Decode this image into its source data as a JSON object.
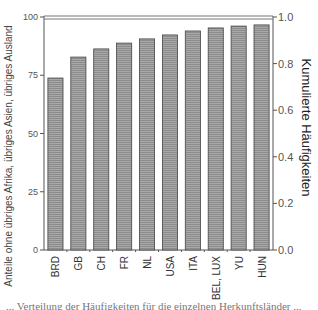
{
  "chart_data": {
    "type": "bar",
    "title": "",
    "categories": [
      "BRD",
      "GB",
      "CH",
      "FR",
      "NL",
      "USA",
      "ITA",
      "BEL, LUX",
      "YU",
      "HUN"
    ],
    "values": [
      73.8,
      82.8,
      86.3,
      88.8,
      90.6,
      92.3,
      94.0,
      95.3,
      96.1,
      96.6
    ],
    "xlabel": "",
    "ylabel": "Anteile ohne übriges Afrika, übriges Asien, übriges Ausland",
    "y2label": "Kumulierte Häufigkeiten",
    "ylim": [
      0,
      100
    ],
    "y2lim": [
      0.0,
      1.0
    ],
    "yticks": [
      "0",
      "25",
      "50",
      "75",
      "100"
    ],
    "y2ticks": [
      "0.0",
      "0.2",
      "0.4",
      "0.6",
      "0.8",
      "1.0"
    ],
    "grid": false,
    "bar_color": "#9a9a9a",
    "bar_edge_color": "#444444"
  },
  "footer_text": "... Verteilung der Häufigkeiten für die einzelnen Herkunftsländer ..."
}
